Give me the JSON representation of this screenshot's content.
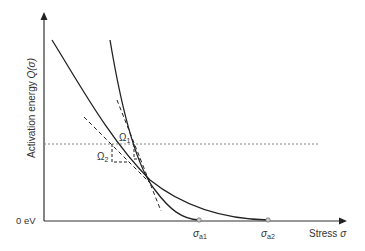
{
  "diagram": {
    "y_axis_label": "Activation energy Q(σ)",
    "y_axis_label_main": "Activation energy ",
    "y_axis_label_func": "Q(",
    "y_axis_label_sigma": "σ",
    "y_axis_label_close": ")",
    "y_zero_label": "0 eV",
    "x_axis_label": "Stress ",
    "x_axis_sigma": "σ",
    "sigma_a1": {
      "sym": "σ",
      "sub": "a1"
    },
    "sigma_a2": {
      "sym": "σ",
      "sub": "a2"
    },
    "omega1": {
      "sym": "Ω",
      "sub": "1"
    },
    "omega2": {
      "sym": "Ω",
      "sub": "2"
    },
    "colors": {
      "curve": "#222222",
      "axis": "#333333",
      "dotted": "#777777",
      "endpoint_fill": "#cccccc"
    }
  }
}
